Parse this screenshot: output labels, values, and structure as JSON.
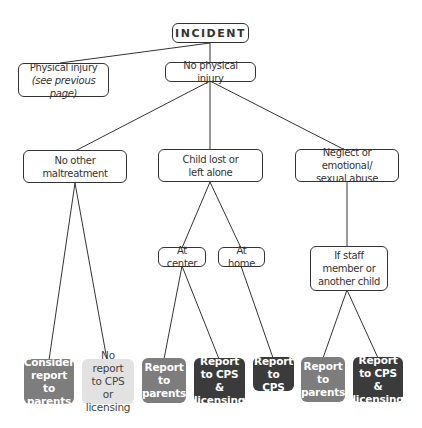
{
  "diagram": {
    "root": {
      "label": "INCIDENT"
    },
    "level1": [
      {
        "line1": "Physical injury",
        "line2": "(see previous page)"
      },
      {
        "label": "No physical injury"
      }
    ],
    "level2": [
      {
        "line1": "No other",
        "line2": "maltreatment"
      },
      {
        "line1": "Child lost or",
        "line2": "left alone"
      },
      {
        "line1": "Neglect or emotional/",
        "line2": "sexual abuse"
      }
    ],
    "level3": [
      {
        "label": "At center"
      },
      {
        "label": "At home"
      },
      {
        "line1": "If staff",
        "line2": "member or",
        "line3": "another child"
      }
    ],
    "outcomes": [
      {
        "line1": "Consider",
        "line2": "report to",
        "line3": "parents",
        "style": "medium"
      },
      {
        "line1": "No report",
        "line2": "to CPS or",
        "line3": "licensing",
        "style": "light"
      },
      {
        "line1": "Report",
        "line2": "to",
        "line3": "parents",
        "style": "medium"
      },
      {
        "line1": "Report",
        "line2": "to CPS &",
        "line3": "licensing",
        "style": "dark"
      },
      {
        "line1": "Report",
        "line2": "to CPS",
        "style": "dark"
      },
      {
        "line1": "Report",
        "line2": "to",
        "line3": "parents",
        "style": "medium"
      },
      {
        "line1": "Report",
        "line2": "to CPS &",
        "line3": "licensing",
        "style": "dark"
      }
    ],
    "colors": {
      "medium": "#7d7d7d",
      "dark": "#3b3b3b",
      "light": "#e2e2e2",
      "line": "#333333"
    }
  }
}
